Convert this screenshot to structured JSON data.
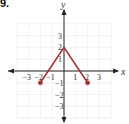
{
  "problem_number": "9.",
  "colors": {
    "function_line": "#a83232",
    "axis": "#222222",
    "grid": "#d4d4d4"
  },
  "chart_data": {
    "type": "line",
    "title": "",
    "xlabel": "x",
    "ylabel": "y",
    "xlim": [
      -4,
      4
    ],
    "ylim": [
      -4,
      4
    ],
    "grid": true,
    "x_ticks": [
      -3,
      -2,
      -1,
      1,
      2,
      3
    ],
    "y_ticks": [
      -3,
      -2,
      -1,
      1,
      2,
      3
    ],
    "x_tick_labels": [
      "−3",
      "−2",
      "−1",
      "1",
      "2",
      "3"
    ],
    "y_tick_labels": [
      "−3",
      "−2",
      "−1",
      "1",
      "2",
      "3"
    ],
    "series": [
      {
        "name": "f",
        "x": [
          -2,
          0,
          2
        ],
        "y": [
          -1,
          2,
          -1
        ],
        "endpoints": [
          {
            "x": -2,
            "y": -1,
            "style": "closed"
          },
          {
            "x": 2,
            "y": -1,
            "style": "closed"
          }
        ]
      }
    ]
  }
}
